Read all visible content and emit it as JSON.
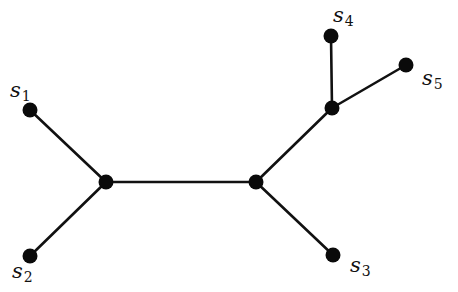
{
  "diagram": {
    "type": "unrooted-tree",
    "nodes": [
      {
        "id": "s1",
        "x": 30,
        "y": 110,
        "label": "s",
        "sub": "1",
        "lx": 10,
        "ly": 97,
        "leaf": true
      },
      {
        "id": "s2",
        "x": 30,
        "y": 256,
        "label": "s",
        "sub": "2",
        "lx": 12,
        "ly": 278,
        "leaf": true
      },
      {
        "id": "s3",
        "x": 333,
        "y": 255,
        "label": "s",
        "sub": "3",
        "lx": 350,
        "ly": 272,
        "leaf": true
      },
      {
        "id": "s4",
        "x": 331,
        "y": 36,
        "label": "s",
        "sub": "4",
        "lx": 333,
        "ly": 22,
        "leaf": true
      },
      {
        "id": "s5",
        "x": 406,
        "y": 65,
        "label": "s",
        "sub": "5",
        "lx": 422,
        "ly": 85,
        "leaf": true
      },
      {
        "id": "a",
        "x": 106,
        "y": 182,
        "leaf": false
      },
      {
        "id": "b",
        "x": 256,
        "y": 182,
        "leaf": false
      },
      {
        "id": "c",
        "x": 332,
        "y": 108,
        "leaf": false
      }
    ],
    "edges": [
      [
        "s1",
        "a"
      ],
      [
        "s2",
        "a"
      ],
      [
        "a",
        "b"
      ],
      [
        "b",
        "s3"
      ],
      [
        "b",
        "c"
      ],
      [
        "c",
        "s4"
      ],
      [
        "c",
        "s5"
      ]
    ],
    "colors": {
      "ink": "#111111",
      "background": "#ffffff"
    }
  }
}
